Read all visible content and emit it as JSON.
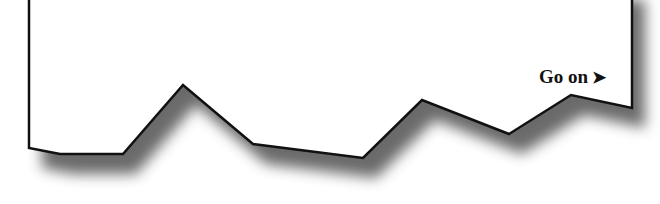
{
  "page": {
    "continue_link": {
      "label": "Go on",
      "arrow_glyph": "➤",
      "icon": "arrow-right-icon"
    }
  },
  "colors": {
    "paper": "#ffffff",
    "outline": "#111111",
    "shadow": "#555555"
  }
}
